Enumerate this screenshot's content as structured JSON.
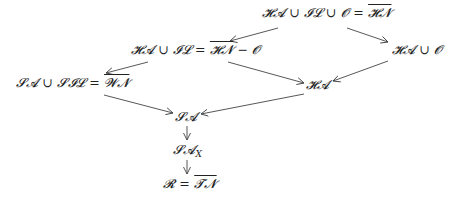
{
  "diagram": {
    "nodes": [
      {
        "id": "n1",
        "lhs": "𝓗𝓐 ∪ 𝓘𝓛 ∪ 𝓞 = ",
        "over": "𝓗𝓝",
        "rhs": ""
      },
      {
        "id": "n2",
        "lhs": "𝓗𝓐 ∪ 𝓘𝓛 = ",
        "over": "𝓗𝓝",
        "rhs": " − 𝓞"
      },
      {
        "id": "n3",
        "lhs": "𝓗𝓐 ∪ 𝓞",
        "over": "",
        "rhs": ""
      },
      {
        "id": "n4",
        "lhs": "𝓢𝓐 ∪ 𝓢𝓘𝓛 = ",
        "over": "𝓦𝓝",
        "rhs": ""
      },
      {
        "id": "n5",
        "lhs": "𝓗𝓐",
        "over": "",
        "rhs": ""
      },
      {
        "id": "n6",
        "lhs": "𝓢𝓐",
        "over": "",
        "rhs": ""
      },
      {
        "id": "n7",
        "lhs": "𝓢𝓐",
        "sub": "X"
      },
      {
        "id": "n8",
        "lhs": "𝓡 = ",
        "over": "𝓣𝓝",
        "rhs": ""
      }
    ],
    "edges": [
      {
        "from": "n1",
        "to": "n2"
      },
      {
        "from": "n1",
        "to": "n3"
      },
      {
        "from": "n2",
        "to": "n4"
      },
      {
        "from": "n2",
        "to": "n5"
      },
      {
        "from": "n3",
        "to": "n5"
      },
      {
        "from": "n4",
        "to": "n6"
      },
      {
        "from": "n5",
        "to": "n6"
      },
      {
        "from": "n6",
        "to": "n7"
      },
      {
        "from": "n7",
        "to": "n8"
      }
    ],
    "line_color": "#444444"
  }
}
